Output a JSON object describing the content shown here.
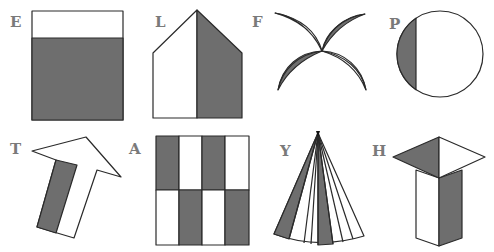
{
  "colors": {
    "shade": "#6e6e6e",
    "outline": "#2a2a2a",
    "fill": "#ffffff",
    "label": "#7a7a7a"
  },
  "figures": [
    {
      "label": "E",
      "shape": "square",
      "shaded": "lower portion (about three-quarters)"
    },
    {
      "label": "L",
      "shape": "pentagon (house)",
      "shaded": "right half"
    },
    {
      "label": "F",
      "shape": "four crossing leaves",
      "shaded": "two leaves shaded on one side"
    },
    {
      "label": "P",
      "shape": "circle",
      "shaded": "left segment"
    },
    {
      "label": "T",
      "shape": "tilted arrow",
      "shaded": "left strip of arrow shaft"
    },
    {
      "label": "A",
      "shape": "rectangle grid 4x2",
      "shaded": "checkerboard alternating"
    },
    {
      "label": "Y",
      "shape": "fan / sector with 8 slices",
      "shaded": "2 slices"
    },
    {
      "label": "H",
      "shape": "prism with square top",
      "shaded": "left half of top and right face"
    }
  ]
}
